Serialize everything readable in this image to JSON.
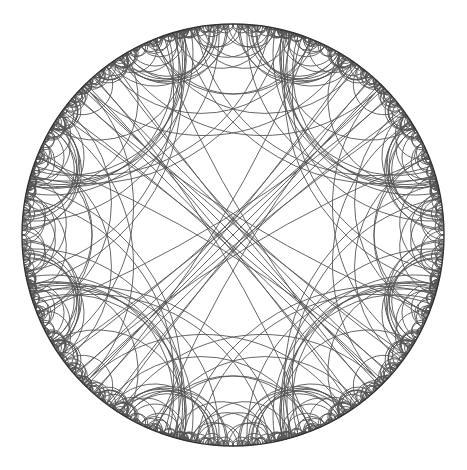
{
  "figure": {
    "title": "Hyperbolic tiling (Poincaré disk)",
    "width": 467,
    "height": 470,
    "background": "#ffffff",
    "line_color": "#555555",
    "boundary_color": "#333333",
    "line_width": 0.9
  },
  "disk": {
    "cx": 233,
    "cy": 235,
    "r": 211
  },
  "generators": {
    "diameters_deg": [
      45,
      135
    ],
    "arcs": [
      {
        "center_deg": 45,
        "half_span_deg": 30
      },
      {
        "center_deg": 135,
        "half_span_deg": 30
      },
      {
        "center_deg": 225,
        "half_span_deg": 30
      },
      {
        "center_deg": 315,
        "half_span_deg": 30
      },
      {
        "center_deg": 108.4,
        "half_span_deg": 14.2
      },
      {
        "center_deg": 71.6,
        "half_span_deg": 14.2
      },
      {
        "center_deg": 198.4,
        "half_span_deg": 14.2
      },
      {
        "center_deg": 161.6,
        "half_span_deg": 14.2
      },
      {
        "center_deg": 288.4,
        "half_span_deg": 14.2
      },
      {
        "center_deg": 251.6,
        "half_span_deg": 14.2
      },
      {
        "center_deg": 18.4,
        "half_span_deg": 14.2
      },
      {
        "center_deg": 341.6,
        "half_span_deg": 14.2
      }
    ],
    "reflection_depth": 3,
    "min_arc_radius_px": 1.2
  }
}
